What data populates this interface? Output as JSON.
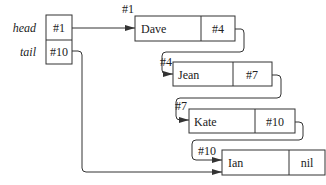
{
  "pointers": {
    "head": {
      "label": "head",
      "value": "#1"
    },
    "tail": {
      "label": "tail",
      "value": "#10"
    }
  },
  "nodes": [
    {
      "address": "#1",
      "name": "Dave",
      "next": "#4"
    },
    {
      "address": "#4",
      "name": "Jean",
      "next": "#7"
    },
    {
      "address": "#7",
      "name": "Kate",
      "next": "#10"
    },
    {
      "address": "#10",
      "name": "Ian",
      "next": "nil"
    }
  ],
  "colors": {
    "stroke": "#333333",
    "background": "#ffffff"
  }
}
